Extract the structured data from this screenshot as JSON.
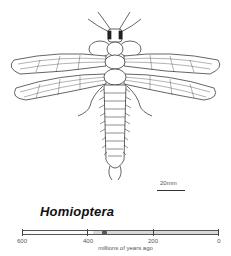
{
  "illustration": {
    "subject": "Homioptera insect, dorsal view line drawing",
    "scale_bar_label": "20mm"
  },
  "title": "Homioptera",
  "timeline": {
    "ticks": [
      {
        "value": 600,
        "label": "600"
      },
      {
        "value": 400,
        "label": "400"
      },
      {
        "value": 200,
        "label": "200"
      },
      {
        "value": 0,
        "label": "0"
      }
    ],
    "range_start": 600,
    "range_end": 0,
    "shaded_from": 385,
    "shaded_to": 0,
    "marker_at": 350,
    "axis_label": "millions of years ago",
    "shade_color": "#d8d8d8",
    "marker_color": "#555555"
  }
}
